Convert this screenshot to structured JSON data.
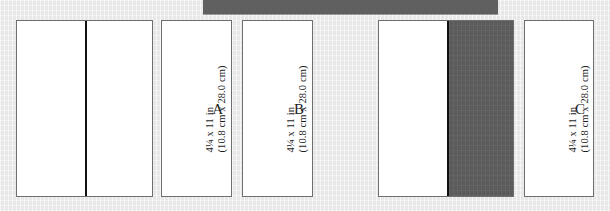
{
  "figure": {
    "name": "paper-folding-diagram",
    "background_color": "#ededed",
    "shade_color": "#606060",
    "sheet_color": "#ffffff",
    "border_color": "#6f6f6f",
    "fold_line_color": "#111111"
  },
  "top_bar": {
    "name": "top-dark-bar",
    "color": "#606060"
  },
  "dimension_text": {
    "line1": "4¼ x 11 in",
    "line2": "(10.8 cm x 28.0 cm)"
  },
  "panels": [
    {
      "id": "unfolded-1",
      "type": "wide",
      "letter": "",
      "has_fold_line": true,
      "shaded": false
    },
    {
      "id": "folded-a",
      "type": "narrow",
      "letter": "A",
      "dim_line1": "4¼ x 11 in",
      "dim_line2": "(10.8 cm x 28.0 cm)",
      "has_fold_line": false,
      "shaded": false
    },
    {
      "id": "folded-b",
      "type": "narrow",
      "letter": "B",
      "dim_line1": "4¼ x 11 in",
      "dim_line2": "(10.8 cm x 28.0 cm)",
      "has_fold_line": false,
      "shaded": false
    },
    {
      "id": "unfolded-2",
      "type": "wide",
      "letter": "",
      "has_fold_line": true,
      "shaded": true
    },
    {
      "id": "folded-c",
      "type": "narrow",
      "letter": "C",
      "dim_line1": "4¼ x 11 in",
      "dim_line2": "(10.8 cm x 28.0 cm)",
      "has_fold_line": false,
      "shaded": false
    }
  ]
}
